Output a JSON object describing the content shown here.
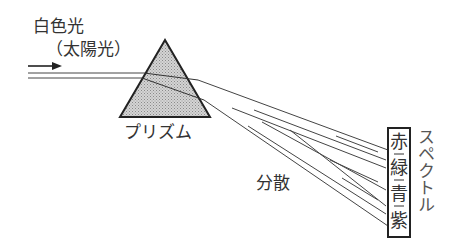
{
  "labels": {
    "white_light": "白色光",
    "sunlight": "（太陽光）",
    "prism": "プリズム",
    "dispersion": "分散",
    "spectrum": "スペクトル"
  },
  "spectrum_colors": [
    "赤",
    "緑",
    "青",
    "紫"
  ],
  "colors": {
    "line": "#333333",
    "prism_fill": "#bdbdbd",
    "background": "#ffffff"
  }
}
